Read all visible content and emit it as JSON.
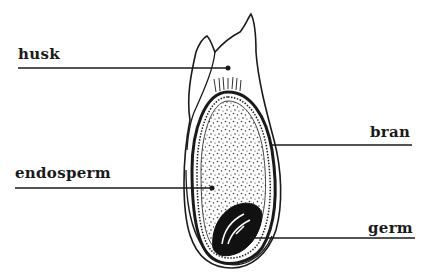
{
  "diagram": {
    "labels": {
      "husk": "husk",
      "bran": "bran",
      "endosperm": "endosperm",
      "germ": "germ"
    },
    "colors": {
      "ink": "#1a1a1a",
      "background": "#ffffff"
    }
  }
}
